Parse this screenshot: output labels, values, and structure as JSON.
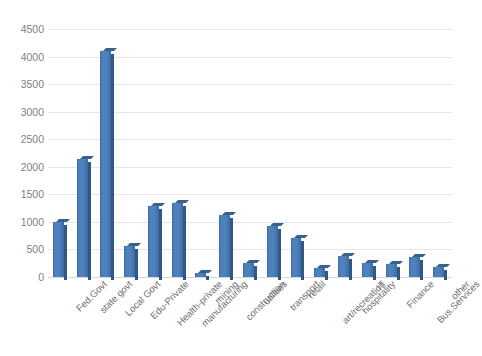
{
  "chart_data": {
    "type": "bar",
    "title": "",
    "subtitle": "",
    "xlabel": "",
    "ylabel": "",
    "ylim": [
      0,
      4500
    ],
    "ytick_step": 500,
    "yticks": [
      "0",
      "500",
      "1000",
      "1500",
      "2000",
      "2500",
      "3000",
      "3500",
      "4000",
      "4500"
    ],
    "grid": true,
    "legend": false,
    "legend_position": "none",
    "bar_style": "3d-clustered-column",
    "categories": [
      "Fed.Govt",
      "state govt",
      "Local Govt",
      "Edu-Private",
      "Health-private",
      "manufacturing",
      "mining",
      "construction",
      "utilities",
      "transport",
      "retail",
      "art/recreation",
      "hospitality",
      "IT",
      "Finance",
      "Bus.Services",
      "other"
    ],
    "values": [
      1000,
      2150,
      4100,
      560,
      1280,
      1340,
      70,
      1130,
      250,
      930,
      710,
      170,
      380,
      250,
      230,
      360,
      180
    ],
    "series": [
      {
        "name": "Series 1",
        "values": [
          1000,
          2150,
          4100,
          560,
          1280,
          1340,
          70,
          1130,
          250,
          930,
          710,
          170,
          380,
          250,
          230,
          360,
          180
        ]
      }
    ]
  },
  "colors": {
    "bar_front": "#4f81bd",
    "bar_side": "#2f5886",
    "bar_top": "#37628f",
    "gridline": "#e4e7ea",
    "axis_text": "#7f7f7f",
    "background": "#ffffff"
  }
}
